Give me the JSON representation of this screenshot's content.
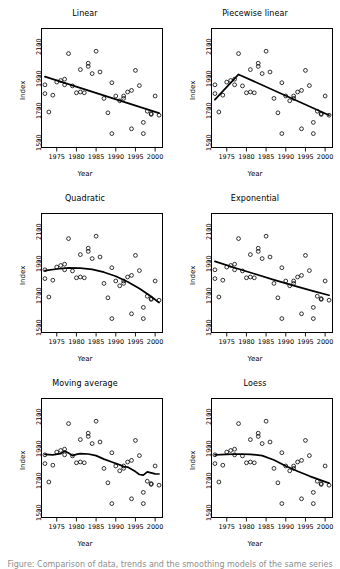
{
  "figure": {
    "rows": 3,
    "cols": 2,
    "background": "#ffffff",
    "ink": "#000000",
    "caption_fragment": "Figure: Comparison of data, trends and the smoothing models of the same series"
  },
  "axes": {
    "xlabel": "Year",
    "ylabel": "Index",
    "xticks": [
      1975,
      1980,
      1985,
      1990,
      1995,
      2000
    ],
    "yticks": [
      1500,
      1700,
      1900,
      2100
    ],
    "xlim": [
      1971.0,
      2002.0
    ],
    "ylim": [
      1450,
      2200
    ]
  },
  "chart_data": {
    "type": "scatter",
    "xlabel": "Year",
    "ylabel": "Index",
    "xlim": [
      1971.0,
      2002.0
    ],
    "ylim": [
      1450,
      2200
    ],
    "xticks": [
      1975,
      1980,
      1985,
      1990,
      1995,
      2000
    ],
    "yticks": [
      1500,
      1700,
      1900,
      2100
    ],
    "grid": false,
    "legend": "none",
    "shared_points": {
      "name": "Index",
      "marker": "open-circle",
      "x": [
        1972,
        1972,
        1973,
        1974,
        1975,
        1976,
        1977,
        1977,
        1978,
        1979,
        1980,
        1981,
        1981,
        1982,
        1983,
        1983,
        1984,
        1985,
        1986,
        1987,
        1988,
        1989,
        1989,
        1990,
        1991,
        1992,
        1992,
        1993,
        1994,
        1994,
        1995,
        1996,
        1997,
        1997,
        1998,
        1999,
        1999,
        2000,
        2001
      ],
      "y": [
        1845,
        1790,
        1675,
        1780,
        1862,
        1872,
        1880,
        1845,
        2040,
        1838,
        1795,
        1940,
        1800,
        1795,
        1960,
        1980,
        1915,
        2055,
        1925,
        1760,
        1670,
        1540,
        1858,
        1775,
        1745,
        1760,
        1775,
        1800,
        1570,
        1810,
        1935,
        1840,
        1540,
        1610,
        1680,
        1665,
        1660,
        1775,
        1655
      ]
    },
    "panels": [
      {
        "index": 0,
        "title": "Linear",
        "fit": "ordinary least squares straight line",
        "fit_points": [
          [
            1972,
            1896
          ],
          [
            2001,
            1668
          ]
        ]
      },
      {
        "index": 1,
        "title": "Piecewise linear",
        "fit": "two-segment broken-stick with breakpoint at 1978",
        "fit_points": [
          [
            1972,
            1752
          ],
          [
            1978,
            1910
          ],
          [
            2001,
            1655
          ]
        ]
      },
      {
        "index": 2,
        "title": "Quadratic",
        "fit": "second order polynomial, concave, peak near 1979",
        "fit_points": [
          [
            1972,
            1840
          ],
          [
            1975,
            1850
          ],
          [
            1978,
            1857
          ],
          [
            1981,
            1856
          ],
          [
            1984,
            1848
          ],
          [
            1987,
            1830
          ],
          [
            1990,
            1805
          ],
          [
            1993,
            1770
          ],
          [
            1996,
            1728
          ],
          [
            1999,
            1678
          ],
          [
            2001,
            1640
          ]
        ]
      },
      {
        "index": 3,
        "title": "Exponential",
        "fit": "exponential decay curve, nearly straight on this range",
        "fit_points": [
          [
            1972,
            1898
          ],
          [
            1977,
            1858
          ],
          [
            1982,
            1820
          ],
          [
            1987,
            1782
          ],
          [
            1992,
            1746
          ],
          [
            1997,
            1712
          ],
          [
            2001,
            1686
          ]
        ]
      },
      {
        "index": 4,
        "title": "Moving average",
        "fit": "centred moving average smoother, wiggly",
        "fit_points": [
          [
            1972,
            1848
          ],
          [
            1974,
            1845
          ],
          [
            1976,
            1852
          ],
          [
            1977,
            1868
          ],
          [
            1978,
            1856
          ],
          [
            1979,
            1840
          ],
          [
            1980,
            1848
          ],
          [
            1981,
            1852
          ],
          [
            1983,
            1850
          ],
          [
            1985,
            1840
          ],
          [
            1987,
            1818
          ],
          [
            1989,
            1800
          ],
          [
            1991,
            1782
          ],
          [
            1992,
            1772
          ],
          [
            1993,
            1768
          ],
          [
            1994,
            1755
          ],
          [
            1995,
            1740
          ],
          [
            1996,
            1722
          ],
          [
            1997,
            1718
          ],
          [
            1998,
            1738
          ],
          [
            1999,
            1732
          ],
          [
            2000,
            1726
          ],
          [
            2001,
            1725
          ]
        ]
      },
      {
        "index": 5,
        "title": "Loess",
        "fit": "locally weighted regression smoother",
        "fit_points": [
          [
            1972,
            1845
          ],
          [
            1975,
            1848
          ],
          [
            1978,
            1850
          ],
          [
            1981,
            1848
          ],
          [
            1984,
            1840
          ],
          [
            1987,
            1812
          ],
          [
            1990,
            1775
          ],
          [
            1993,
            1742
          ],
          [
            1996,
            1712
          ],
          [
            1999,
            1685
          ],
          [
            2001,
            1668
          ]
        ]
      }
    ]
  }
}
